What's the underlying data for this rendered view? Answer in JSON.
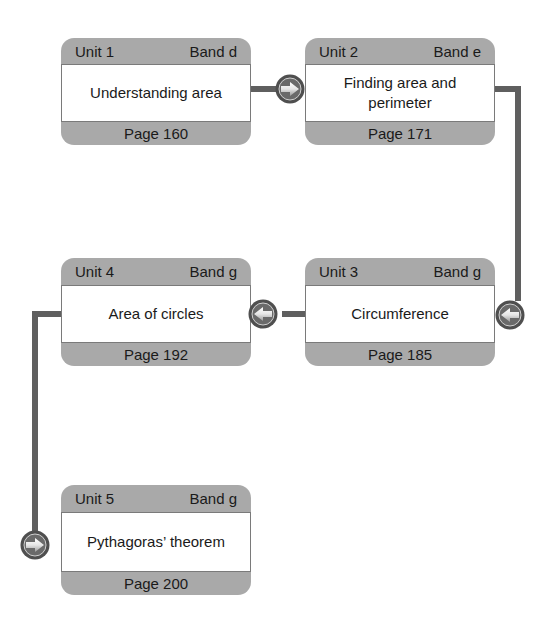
{
  "colors": {
    "box_frame": "#a9a9a9",
    "box_body": "#ffffff",
    "connector": "#5f5f5f",
    "arrow_ring": "#4f4f4f"
  },
  "units": [
    {
      "unit": "Unit 1",
      "band": "Band d",
      "title": "Understanding area",
      "page": "Page 160"
    },
    {
      "unit": "Unit 2",
      "band": "Band e",
      "title": "Finding area and perimeter",
      "page": "Page 171"
    },
    {
      "unit": "Unit 3",
      "band": "Band g",
      "title": "Circumference",
      "page": "Page 185"
    },
    {
      "unit": "Unit 4",
      "band": "Band g",
      "title": "Area of circles",
      "page": "Page 192"
    },
    {
      "unit": "Unit 5",
      "band": "Band g",
      "title": "Pythagoras’ theorem",
      "page": "Page 200"
    }
  ],
  "arrows": [
    {
      "icon": "arrow-right-icon",
      "into": "Unit 2"
    },
    {
      "icon": "arrow-left-icon",
      "into": "Unit 3"
    },
    {
      "icon": "arrow-left-icon",
      "into": "Unit 4"
    },
    {
      "icon": "arrow-right-icon",
      "into": "Unit 5"
    }
  ]
}
